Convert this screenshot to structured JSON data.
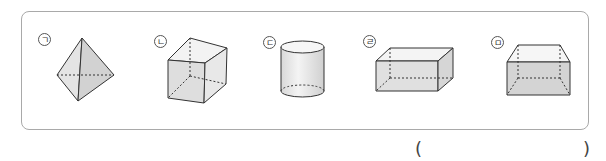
{
  "figures": [
    {
      "label": "ㄱ",
      "shape": "triangular-pyramid"
    },
    {
      "label": "ㄴ",
      "shape": "cube"
    },
    {
      "label": "ㄷ",
      "shape": "cylinder"
    },
    {
      "label": "ㄹ",
      "shape": "rectangular-prism"
    },
    {
      "label": "ㅁ",
      "shape": "truncated-prism"
    }
  ],
  "answer": {
    "open": "(",
    "close": ")",
    "value": ""
  }
}
